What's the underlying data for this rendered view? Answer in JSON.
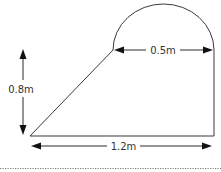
{
  "diagram": {
    "type": "composite-shape-with-dimensions",
    "colors": {
      "stroke": "#3a3a3a",
      "arrow": "#111111",
      "text": "#333333",
      "separator": "#7a7a7a"
    },
    "dimensions": {
      "height_label": "0.8m",
      "semicircle_diameter_label": "0.5m",
      "base_label": "1.2m"
    },
    "components": [
      {
        "name": "semicircle",
        "diameter": "0.5m"
      },
      {
        "name": "slanted-left-edge"
      },
      {
        "name": "right-vertical-edge",
        "height": "0.8m"
      },
      {
        "name": "base",
        "length": "1.2m"
      }
    ]
  }
}
